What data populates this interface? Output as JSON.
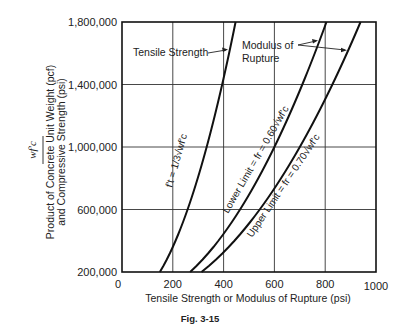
{
  "chart_data": {
    "type": "line",
    "title": "",
    "caption": "Fig. 3-15",
    "xlabel": "Tensile Strength or Modulus of Rupture (psi)",
    "ylabel_symbol": "wf'c",
    "ylabel_line1": "Product of Concrete Unit Weight (pcf)",
    "ylabel_line2": "and Compressive Strength (psi)",
    "xlim": [
      0,
      1000
    ],
    "ylim": [
      200000,
      1800000
    ],
    "x_ticks": [
      0,
      200,
      400,
      600,
      800,
      1000
    ],
    "x_tick_labels": [
      "0",
      "200",
      "400",
      "600",
      "800",
      "1000"
    ],
    "y_ticks": [
      200000,
      600000,
      1000000,
      1400000,
      1800000
    ],
    "y_tick_labels": [
      "200,000",
      "600,000",
      "1,000,000",
      "1,400,000",
      "1,800,000"
    ],
    "grid": true,
    "legend": "none (inline labels)",
    "series": [
      {
        "name": "Tensile Strength",
        "formula_label": "f't = 1/3√(wf'c)",
        "coefficient": 0.3333,
        "points": [
          [
            149,
            200000
          ],
          [
            258,
            600000
          ],
          [
            333,
            1000000
          ],
          [
            394,
            1400000
          ],
          [
            447,
            1800000
          ]
        ]
      },
      {
        "name": "Lower Limit (Modulus of Rupture)",
        "formula_label": "Lower Limit = fr = 0.60√(wf'c)",
        "coefficient": 0.6,
        "points": [
          [
            268,
            200000
          ],
          [
            465,
            600000
          ],
          [
            600,
            1000000
          ],
          [
            710,
            1400000
          ],
          [
            805,
            1800000
          ]
        ]
      },
      {
        "name": "Upper Limit (Modulus of Rupture)",
        "formula_label": "Upper Limit = fr = 0.70√(wf'c)",
        "coefficient": 0.7,
        "points": [
          [
            313,
            200000
          ],
          [
            542,
            600000
          ],
          [
            700,
            1000000
          ],
          [
            828,
            1400000
          ],
          [
            939,
            1800000
          ]
        ]
      }
    ],
    "annotations": [
      {
        "text": "Tensile Strength",
        "points_to": "Tensile Strength"
      },
      {
        "text": "Modulus of",
        "text2": "Rupture",
        "points_to": [
          "Lower Limit",
          "Upper Limit"
        ]
      }
    ]
  },
  "labels": {
    "tensile": "Tensile Strength",
    "modulus_1": "Modulus of",
    "modulus_2": "Rupture",
    "curve_tensile": "f't = 1/3√wf'c",
    "curve_lower": "Lower Limit = fr = 0.60√wf'c",
    "curve_upper": "Upper Limit = fr = 0.70√wf'c",
    "caption": "Fig. 3-15"
  }
}
